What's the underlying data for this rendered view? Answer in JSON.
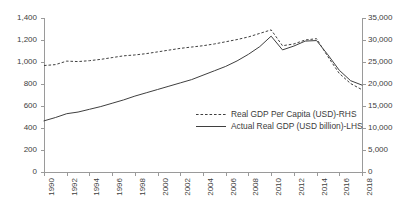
{
  "chart_data": {
    "type": "line",
    "title": "",
    "subtitle": "",
    "xlabel": "",
    "ylabel": "",
    "grid": false,
    "legend_position": "center-bottom-inside",
    "x": [
      1990,
      1991,
      1992,
      1993,
      1994,
      1995,
      1996,
      1997,
      1998,
      1999,
      2000,
      2001,
      2002,
      2003,
      2004,
      2005,
      2006,
      2007,
      2008,
      2009,
      2010,
      2011,
      2012,
      2013,
      2014,
      2015,
      2016,
      2017,
      2018
    ],
    "xtick_labels": [
      "1990",
      "1992",
      "1994",
      "1996",
      "1998",
      "2000",
      "2002",
      "2004",
      "2006",
      "2008",
      "2010",
      "2012",
      "2014",
      "2016",
      "2018"
    ],
    "axes": {
      "left": {
        "label": "Actual Real GDP (USD billion)",
        "side": "LHS",
        "min": 0,
        "max": 1400,
        "step": 200,
        "ticks": [
          "0",
          "200",
          "400",
          "600",
          "800",
          "1,000",
          "1,200",
          "1,400"
        ]
      },
      "right": {
        "label": "Real GDP Per Capita (USD)",
        "side": "RHS",
        "min": 0,
        "max": 35000,
        "step": 5000,
        "ticks": [
          "0",
          "5,000",
          "10,000",
          "15,000",
          "20,000",
          "25,000",
          "30,000",
          "35,000"
        ]
      }
    },
    "series": [
      {
        "name": "Real GDP Per Capita (USD)-RHS",
        "axis": "right",
        "style": "dashed",
        "color": "#3f3f3f",
        "values": [
          24200,
          24400,
          25200,
          25100,
          25300,
          25600,
          26000,
          26400,
          26600,
          26900,
          27300,
          27700,
          28100,
          28400,
          28700,
          29100,
          29600,
          30100,
          30700,
          31500,
          32300,
          28700,
          29100,
          30000,
          30300,
          26200,
          22400,
          20100,
          18700
        ]
      },
      {
        "name": "Actual Real GDP (USD billion)-LHS",
        "axis": "left",
        "style": "solid",
        "color": "#3f3f3f",
        "values": [
          465,
          495,
          530,
          545,
          570,
          595,
          625,
          655,
          690,
          720,
          750,
          780,
          810,
          840,
          880,
          920,
          960,
          1010,
          1070,
          1140,
          1235,
          1110,
          1145,
          1190,
          1195,
          1065,
          925,
          830,
          790
        ]
      }
    ]
  },
  "legend": {
    "items": [
      {
        "label": "Real GDP Per Capita (USD)-RHS",
        "style": "dashed"
      },
      {
        "label": "Actual Real GDP (USD billion)-LHS",
        "style": "solid"
      }
    ]
  }
}
